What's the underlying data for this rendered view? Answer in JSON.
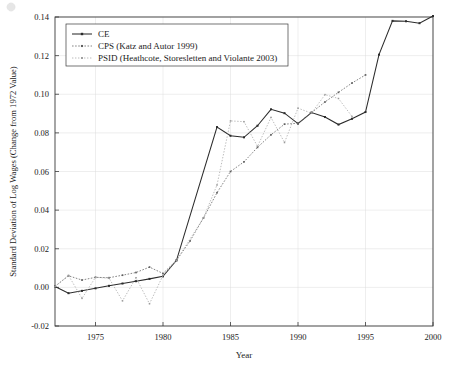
{
  "figure": {
    "background_color": "#ffffff",
    "grid_color": "#dcdcdc",
    "axis_color": "#3a3a3a"
  },
  "chart_data": {
    "type": "line",
    "title": "",
    "xlabel": "Year",
    "ylabel": "Standard Deviation of Log Wages (Change from 1972 Value)",
    "xlim": [
      1972,
      2000
    ],
    "ylim": [
      -0.02,
      0.14
    ],
    "xticks": [
      1975,
      1980,
      1985,
      1990,
      1995,
      2000
    ],
    "xtick_labels": [
      "1975",
      "1980",
      "1985",
      "1990",
      "1995",
      "2000"
    ],
    "yticks": [
      -0.02,
      0.0,
      0.02,
      0.04,
      0.06,
      0.08,
      0.1,
      0.12,
      0.14
    ],
    "ytick_labels": [
      "-0.02",
      "0.00",
      "0.02",
      "0.04",
      "0.06",
      "0.08",
      "0.10",
      "0.12",
      "0.14"
    ],
    "grid": true,
    "legend_position": "upper left",
    "series": [
      {
        "name": "CE",
        "color": "#2b2b2b",
        "linestyle": "solid",
        "marker": "square",
        "x": [
          1972,
          1973,
          1974,
          1975,
          1976,
          1977,
          1978,
          1979,
          1980,
          1981,
          1984,
          1985,
          1986,
          1987,
          1988,
          1989,
          1990,
          1991,
          1992,
          1993,
          1994,
          1995,
          1996,
          1997,
          1998,
          1999,
          2000
        ],
        "y": [
          0.0005,
          -0.003,
          -0.0018,
          -0.0005,
          0.0008,
          0.002,
          0.0032,
          0.0044,
          0.0057,
          0.014,
          0.083,
          0.0785,
          0.0777,
          0.0837,
          0.0922,
          0.0902,
          0.0848,
          0.0905,
          0.0882,
          0.0843,
          0.0873,
          0.0908,
          0.1205,
          0.138,
          0.1378,
          0.1368,
          0.1405
        ]
      },
      {
        "name": "CPS (Katz and Autor 1999)",
        "color": "#5f5f5f",
        "linestyle": "dotted",
        "marker": "square",
        "x": [
          1972,
          1973,
          1974,
          1975,
          1976,
          1977,
          1978,
          1979,
          1980,
          1981,
          1982,
          1983,
          1984,
          1985,
          1986,
          1987,
          1988,
          1989,
          1990,
          1991,
          1992,
          1993,
          1994,
          1995
        ],
        "y": [
          0.0005,
          0.006,
          0.0038,
          0.0052,
          0.005,
          0.0063,
          0.0077,
          0.0105,
          0.0072,
          0.014,
          0.024,
          0.036,
          0.049,
          0.06,
          0.065,
          0.0725,
          0.079,
          0.0845,
          0.085,
          0.0905,
          0.096,
          0.101,
          0.1058,
          0.11
        ]
      },
      {
        "name": "PSID (Heathcote, Storesletten and Violante 2003)",
        "color": "#9a9a9a",
        "linestyle": "dotted",
        "marker": "square",
        "x": [
          1972,
          1973,
          1974,
          1975,
          1976,
          1977,
          1978,
          1979,
          1980,
          1981,
          1983,
          1984,
          1985,
          1986,
          1987,
          1988,
          1989,
          1990,
          1991,
          1992,
          1993,
          1994
        ],
        "y": [
          0.0005,
          0.0062,
          -0.0057,
          0.0052,
          0.0048,
          -0.007,
          0.005,
          -0.0085,
          0.0062,
          0.014,
          0.036,
          0.053,
          0.0862,
          0.0858,
          0.073,
          0.088,
          0.075,
          0.0928,
          0.0902,
          0.0998,
          0.0978,
          0.0885
        ]
      }
    ]
  },
  "legend": {
    "items": [
      {
        "label": "CE"
      },
      {
        "label": "CPS (Katz and Autor 1999)"
      },
      {
        "label": "PSID (Heathcote, Storesletten and Violante 2003)"
      }
    ]
  }
}
